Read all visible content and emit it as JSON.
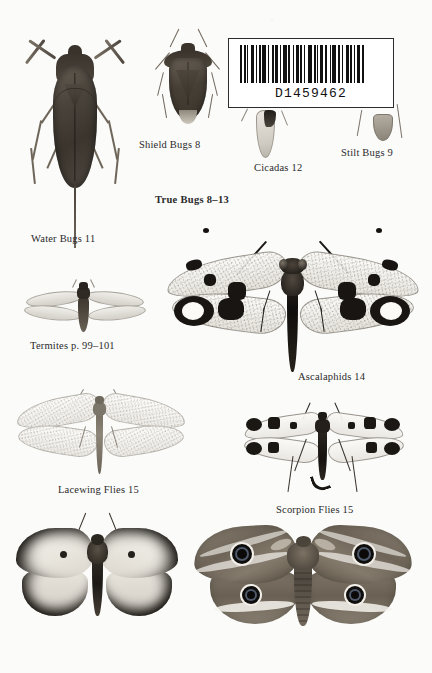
{
  "page": {
    "type": "field-guide-colour-plate",
    "background_color": "#fbfbfa",
    "ink_color": "#2a2a2a"
  },
  "barcode_label": {
    "name": "library-barcode-sticker",
    "number": "D1459462",
    "background_color": "#ffffff",
    "bar_color": "#111111"
  },
  "figures": [
    {
      "id": "water-bug",
      "caption_text": "Water Bugs",
      "caption_ref": "11",
      "caption_full": "Water Bugs  11"
    },
    {
      "id": "shield-bug",
      "caption_text": "Shield Bugs",
      "caption_ref": "8",
      "caption_full": "Shield Bugs  8"
    },
    {
      "id": "cicada",
      "caption_text": "Cicadas",
      "caption_ref": "12",
      "caption_full": "Cicadas  12"
    },
    {
      "id": "stilt-bug",
      "caption_text": "Stilt Bugs",
      "caption_ref": "9",
      "caption_full": "Stilt Bugs  9"
    },
    {
      "id": "termite",
      "caption_text": "Termites",
      "caption_ref": "p. 99–101",
      "caption_full": "Termites  p. 99–101"
    },
    {
      "id": "ascalaphid",
      "caption_text": "Ascalaphids",
      "caption_ref": "14",
      "caption_full": "Ascalaphids  14"
    },
    {
      "id": "lacewing-fly",
      "caption_text": "Lacewing Flies",
      "caption_ref": "15",
      "caption_full": "Lacewing Flies  15"
    },
    {
      "id": "scorpion-fly",
      "caption_text": "Scorpion Flies",
      "caption_ref": "15",
      "caption_full": "Scorpion Flies  15"
    },
    {
      "id": "butterfly",
      "caption_text": "",
      "caption_ref": "",
      "caption_full": ""
    },
    {
      "id": "emperor-moth",
      "caption_text": "",
      "caption_ref": "",
      "caption_full": ""
    }
  ],
  "group_heading": {
    "text": "True Bugs",
    "ref": "8–13",
    "full": "True Bugs  8–13"
  },
  "captions": {
    "shield_bugs": "Shield Bugs  8",
    "cicadas": "Cicadas  12",
    "stilt_bugs": "Stilt Bugs  9",
    "true_bugs": "True Bugs  8–13",
    "water_bugs": "Water Bugs  11",
    "termites": "Termites  p. 99–101",
    "ascalaphids": "Ascalaphids  14",
    "lacewing_flies": "Lacewing Flies  15",
    "scorpion_flies": "Scorpion Flies  15"
  }
}
